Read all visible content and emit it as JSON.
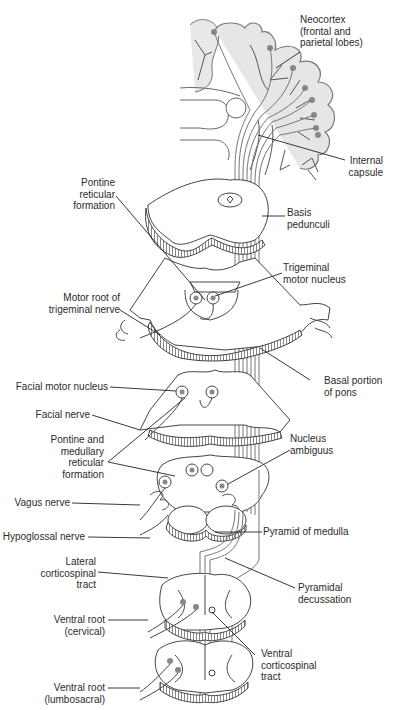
{
  "figure": {
    "colors": {
      "line": "#3a3a3a",
      "tract": "#7a7a7a",
      "cortex_fill": "#e6e6e6",
      "nucleus": "#8a8a8a",
      "background": "#ffffff"
    }
  },
  "labels": {
    "neocortex": {
      "l1": "Neocortex",
      "l2": "(frontal and",
      "l3": "parietal lobes)"
    },
    "internal_capsule": {
      "l1": "Internal",
      "l2": "capsule"
    },
    "pontine_reticular": {
      "l1": "Pontine",
      "l2": "reticular",
      "l3": "formation"
    },
    "basis_pedunculi": {
      "l1": "Basis",
      "l2": "pedunculi"
    },
    "trigeminal_motor_nucleus": {
      "l1": "Trigeminal",
      "l2": "motor nucleus"
    },
    "motor_root_trigeminal": {
      "l1": "Motor root of",
      "l2": "trigeminal nerve"
    },
    "basal_pons": {
      "l1": "Basal portion",
      "l2": "of pons"
    },
    "facial_motor_nucleus": {
      "l1": "Facial motor nucleus"
    },
    "facial_nerve": {
      "l1": "Facial nerve"
    },
    "pontine_medullary_reticular": {
      "l1": "Pontine and",
      "l2": "medullary",
      "l3": "reticular",
      "l4": "formation"
    },
    "nucleus_ambiguus": {
      "l1": "Nucleus",
      "l2": "ambiguus"
    },
    "vagus_nerve": {
      "l1": "Vagus nerve"
    },
    "hypoglossal_nerve": {
      "l1": "Hypoglossal nerve"
    },
    "pyramid_medulla": {
      "l1": "Pyramid of medulla"
    },
    "lateral_corticospinal": {
      "l1": "Lateral",
      "l2": "corticospinal",
      "l3": "tract"
    },
    "pyramidal_decussation": {
      "l1": "Pyramidal",
      "l2": "decussation"
    },
    "ventral_root_cervical": {
      "l1": "Ventral root",
      "l2": "(cervical)"
    },
    "ventral_corticospinal": {
      "l1": "Ventral",
      "l2": "corticospinal",
      "l3": "tract"
    },
    "ventral_root_lumbosacral": {
      "l1": "Ventral root",
      "l2": "(lumbosacral)"
    }
  }
}
